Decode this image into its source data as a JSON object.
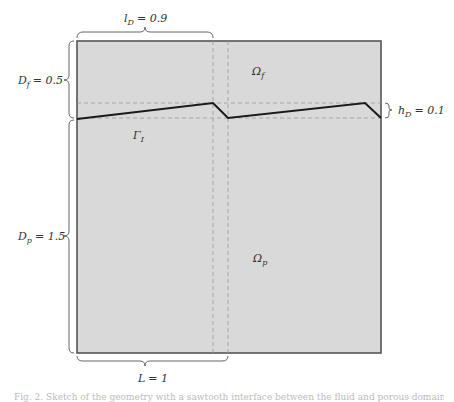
{
  "figure": {
    "regions": {
      "fluid": {
        "label": "Ω",
        "sub": "f"
      },
      "porous": {
        "label": "Ω",
        "sub": "p"
      },
      "interface": {
        "label": "Γ",
        "sub": "I"
      }
    },
    "dimensions": {
      "lD": {
        "name": "l",
        "sub": "D",
        "value": "= 0.9"
      },
      "Df": {
        "name": "D",
        "sub": "f",
        "value": "= 0.5"
      },
      "Dp": {
        "name": "D",
        "sub": "p",
        "value": "= 1.5"
      },
      "hD": {
        "name": "h",
        "sub": "D",
        "value": "= 0.1"
      },
      "L": {
        "name": "L",
        "value": "= 1"
      }
    },
    "colors": {
      "domain_fill": "#d9d9d9",
      "boundary": "#555555",
      "interface_line": "#1a1a1a",
      "dashed_guides": "#999999"
    }
  },
  "caption": {
    "text": "Fig. 2. Sketch of the geometry with a sawtooth interface between the fluid and porous domains; D_f = 0.5, D_p = 1.5."
  }
}
